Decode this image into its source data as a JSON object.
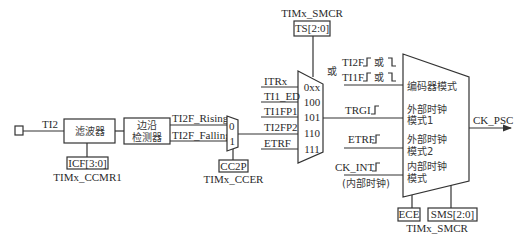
{
  "diagram": {
    "input": {
      "signal_label": "TI2"
    },
    "filter": {
      "label": "滤波器",
      "config_reg": "ICF[3:0]",
      "config_reg_owner": "TIMx_CCMR1"
    },
    "edge_detector": {
      "label_line1": "边沿",
      "label_line2": "检测器",
      "outputs": [
        "TI2F_Rising",
        "TI2F_Falling"
      ]
    },
    "polarity_mux": {
      "inputs": [
        "0",
        "1"
      ],
      "select_reg": "CC2P",
      "select_reg_owner": "TIMx_CCER"
    },
    "trigger_mux": {
      "select_reg_owner": "TIMx_SMCR",
      "select_reg": "TS[2:0]",
      "inputs": [
        {
          "signal": "ITRx",
          "code": "0xx"
        },
        {
          "signal": "TI1_ED",
          "code": "100"
        },
        {
          "signal": "TI1FP1",
          "code": "101"
        },
        {
          "signal": "TI2FP2",
          "code": "110"
        },
        {
          "signal": "ETRF",
          "code": "111"
        }
      ]
    },
    "mode_mux": {
      "encoder_inputs": {
        "or_label": "或",
        "line1_signal": "TI2F",
        "line2_signal": "TI1F",
        "or_text": "或"
      },
      "trgi_label": "TRGI",
      "etrf_label": "ETRF",
      "ckint_label": "CK_INT",
      "ckint_note": "(内部时钟)",
      "modes": [
        {
          "line1": "编码器模式",
          "line2": ""
        },
        {
          "line1": "外部时钟",
          "line2": "模式1"
        },
        {
          "line1": "外部时钟",
          "line2": "模式2"
        },
        {
          "line1": "内部时钟",
          "line2": "模式"
        }
      ],
      "control_regs": [
        "ECE",
        "SMS[2:0]"
      ],
      "control_reg_owner": "TIMx_SMCR",
      "output": "CK_PSC"
    }
  }
}
